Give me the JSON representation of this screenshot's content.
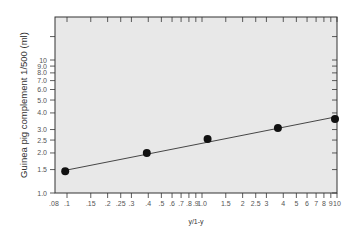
{
  "chart_data": {
    "type": "scatter",
    "title": "",
    "xlabel": "y/1-y",
    "ylabel": "Guinea pig complement 1/500 (ml)",
    "xscale": "log",
    "yscale": "log",
    "xlim": [
      0.08,
      10
    ],
    "ylim": [
      1.0,
      20
    ],
    "grid": false,
    "legend": null,
    "x_tick_labels": [
      ".08",
      ".1",
      ".15",
      ".2",
      ".25",
      ".3",
      ".4",
      ".5",
      ".6",
      ".7",
      ".8",
      ".9",
      "1.0",
      "1.5",
      "2",
      "2.5",
      "3",
      "4",
      "5",
      "6",
      "7",
      "8",
      "9",
      "10"
    ],
    "y_tick_labels": [
      "1.0",
      "1.5",
      "2.0",
      "2.5",
      "3.0",
      "4.0",
      "5.0",
      "6.0",
      "7.0",
      "8.0",
      "9.0",
      "10"
    ],
    "series": [
      {
        "name": "data points",
        "marker": "filled-circle",
        "x": [
          0.097,
          0.39,
          1.1,
          3.65,
          9.7
        ],
        "y": [
          1.46,
          2.0,
          2.55,
          3.08,
          3.6
        ]
      },
      {
        "name": "fit line",
        "type": "line",
        "x": [
          0.097,
          10
        ],
        "y": [
          1.48,
          3.75
        ]
      }
    ]
  },
  "colors": {
    "plot_background": "#e8e8e8",
    "axis": "#333333",
    "marker": "#111111",
    "line": "#333333"
  }
}
